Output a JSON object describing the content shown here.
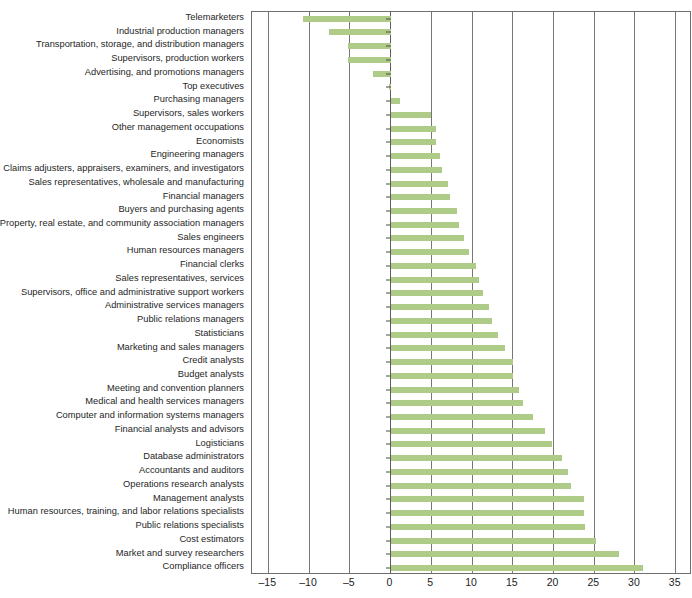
{
  "chart_data": {
    "type": "bar",
    "orientation": "horizontal",
    "title": "",
    "xlabel": "",
    "ylabel": "",
    "xlim": [
      -17,
      37
    ],
    "xticks": [
      -15,
      -10,
      -5,
      0,
      5,
      10,
      15,
      20,
      25,
      30,
      35
    ],
    "xtick_labels": [
      "–15",
      "–10",
      "–5",
      "0",
      "5",
      "10",
      "15",
      "20",
      "25",
      "30",
      "35"
    ],
    "grid": true,
    "grid_axis": "x",
    "legend": null,
    "bar_color": "#aecb87",
    "frame_color": "#6f6f6f",
    "categories": [
      "Telemarketers",
      "Industrial production managers",
      "Transportation, storage, and distribution managers",
      "Supervisors, production workers",
      "Advertising, and promotions managers",
      "Top executives",
      "Purchasing managers",
      "Supervisors, sales workers",
      "Other management occupations",
      "Economists",
      "Engineering managers",
      "Claims adjusters, appraisers, examiners, and investigators",
      "Sales representatives, wholesale and manufacturing",
      "Financial managers",
      "Buyers and purchasing agents",
      "Property, real estate, and community association managers",
      "Sales engineers",
      "Human resources managers",
      "Financial clerks",
      "Sales representatives, services",
      "Supervisors, office and administrative support workers",
      "Administrative services managers",
      "Public relations managers",
      "Statisticians",
      "Marketing and sales managers",
      "Credit analysts",
      "Budget analysts",
      "Meeting and convention planners",
      "Medical and health services managers",
      "Computer and information systems managers",
      "Financial analysts and advisors",
      "Logisticians",
      "Database administrators",
      "Accountants and auditors",
      "Operations research analysts",
      "Management analysts",
      "Human resources, training, and labor relations specialists",
      "Public relations specialists",
      "Cost estimators",
      "Market and survey researchers",
      "Compliance officers"
    ],
    "values": [
      -10.8,
      -7.5,
      -5.2,
      -5.2,
      -2.2,
      -0.2,
      1.2,
      5.0,
      5.6,
      5.6,
      6.1,
      6.3,
      7.0,
      7.3,
      8.1,
      8.4,
      9.0,
      9.6,
      10.5,
      10.9,
      11.3,
      12.1,
      12.5,
      13.2,
      14.1,
      15.0,
      15.0,
      15.8,
      16.3,
      17.5,
      19.0,
      19.8,
      21.1,
      21.8,
      22.2,
      23.7,
      23.7,
      23.9,
      25.2,
      28.1,
      31.0
    ]
  }
}
